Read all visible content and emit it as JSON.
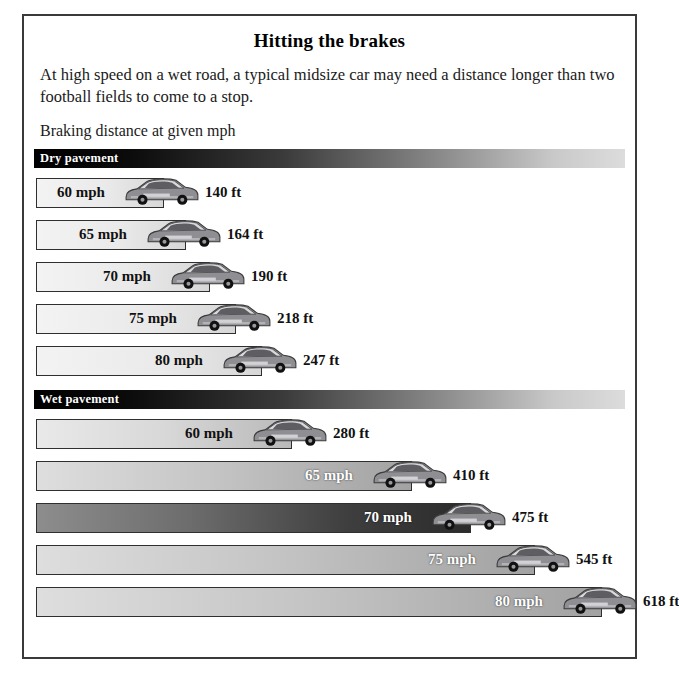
{
  "title": "Hitting the brakes",
  "deck": "At high speed on a wet road, a typical midsize car may need a distance longer than two football fields to come to a stop.",
  "subtitle": "Braking distance at given mph",
  "sections": [
    {
      "label": "Dry pavement"
    },
    {
      "label": "Wet pavement"
    }
  ],
  "chart_data": {
    "type": "bar",
    "title": "Hitting the brakes",
    "subtitle": "Braking distance at given mph",
    "xlabel": "Braking distance (ft)",
    "ylabel": "Speed (mph)",
    "orientation": "horizontal",
    "unit": "ft",
    "grid": false,
    "legend": false,
    "categories": [
      "60 mph",
      "65 mph",
      "70 mph",
      "75 mph",
      "80 mph"
    ],
    "series": [
      {
        "name": "Dry pavement",
        "values": [
          140,
          164,
          190,
          218,
          247
        ]
      },
      {
        "name": "Wet pavement",
        "values": [
          280,
          410,
          475,
          545,
          618
        ]
      }
    ],
    "xlim": [
      0,
      618
    ],
    "annotations": [
      "At high speed on a wet road, a typical midsize car may need a distance longer than two football fields to come to a stop."
    ]
  },
  "dry_rows": [
    {
      "mph": "60 mph",
      "ft": "140 ft"
    },
    {
      "mph": "65 mph",
      "ft": "164 ft"
    },
    {
      "mph": "70 mph",
      "ft": "190 ft"
    },
    {
      "mph": "75 mph",
      "ft": "218 ft"
    },
    {
      "mph": "80 mph",
      "ft": "247 ft"
    }
  ],
  "wet_rows": [
    {
      "mph": "60 mph",
      "ft": "280 ft"
    },
    {
      "mph": "65 mph",
      "ft": "410 ft"
    },
    {
      "mph": "70 mph",
      "ft": "475 ft"
    },
    {
      "mph": "75 mph",
      "ft": "545 ft"
    },
    {
      "mph": "80 mph",
      "ft": "618 ft"
    }
  ]
}
